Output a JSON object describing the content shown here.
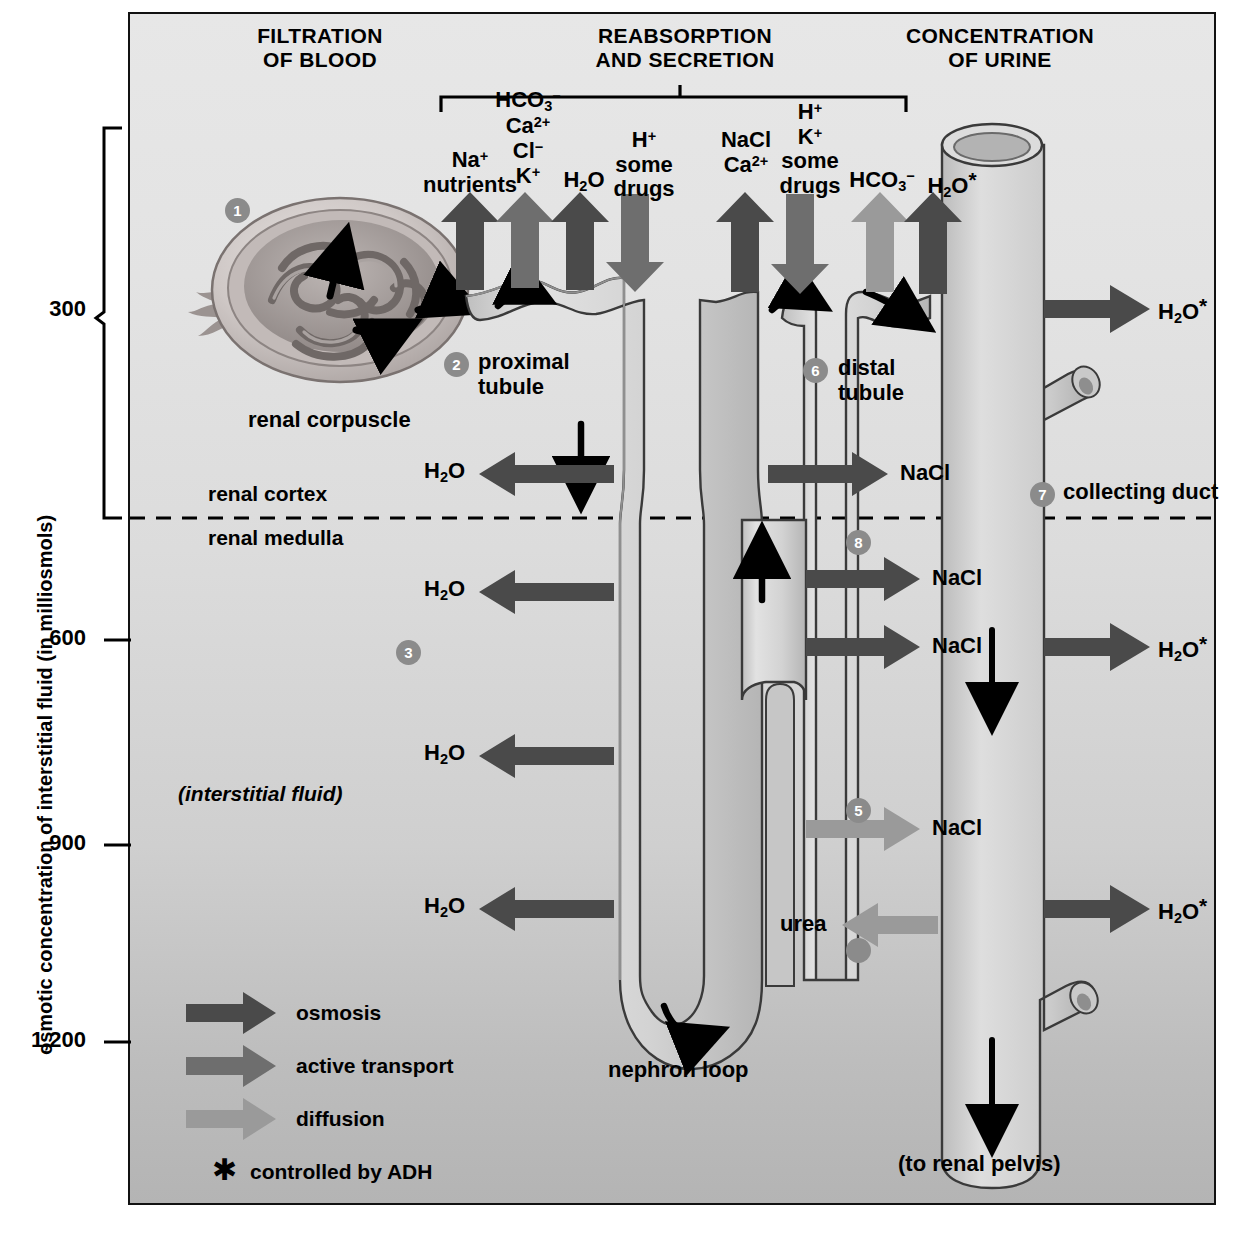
{
  "figure": {
    "type": "anatomical-diagram"
  },
  "headers": [
    {
      "id": "filtration",
      "line1": "FILTRATION",
      "line2": "OF BLOOD"
    },
    {
      "id": "reabsorption",
      "line1": "REABSORPTION",
      "line2": "AND SECRETION"
    },
    {
      "id": "concentration",
      "line1": "CONCENTRATION",
      "line2": "OF URINE"
    }
  ],
  "axis": {
    "title": "osmotic concentration of interstitial fluid (in milliosmols)",
    "ticks": [
      "300",
      "600",
      "900",
      "1,200"
    ]
  },
  "regions": {
    "cortex": "renal cortex",
    "medulla": "renal medulla",
    "interstitial": "(interstitial fluid)"
  },
  "structures": [
    {
      "num": "1",
      "label": "renal corpuscle"
    },
    {
      "num": "2",
      "label_line1": "proximal",
      "label_line2": "tubule"
    },
    {
      "num": "6",
      "label_line1": "distal",
      "label_line2": "tubule"
    },
    {
      "num": "7",
      "label": "collecting duct"
    },
    {
      "num": "3",
      "label": ""
    },
    {
      "num": "4",
      "label": ""
    },
    {
      "num": "5",
      "label": ""
    },
    {
      "num": "8",
      "label": ""
    }
  ],
  "loop_label": "nephron loop",
  "pelvis_label": "(to renal pelvis)",
  "proximal_transport": [
    {
      "id": "na-nutrients",
      "lines": [
        "Na⁺",
        "nutrients"
      ],
      "arrow": "up",
      "mode": "osmosis"
    },
    {
      "id": "hco3-ca-cl-k",
      "lines": [
        "HCO₃⁻",
        "Ca²⁺",
        "Cl⁻",
        "K⁺"
      ],
      "arrow": "up",
      "mode": "active_transport"
    },
    {
      "id": "h2o-proximal",
      "lines": [
        "H₂O"
      ],
      "arrow": "up",
      "mode": "osmosis"
    },
    {
      "id": "h-some-drugs",
      "lines": [
        "H⁺",
        "some",
        "drugs"
      ],
      "arrow": "down",
      "mode": "active_transport"
    }
  ],
  "distal_transport": [
    {
      "id": "nacl-ca",
      "lines": [
        "NaCl",
        "Ca²⁺"
      ],
      "arrow": "up",
      "mode": "osmosis"
    },
    {
      "id": "h-k-some-drugs",
      "lines": [
        "H⁺",
        "K⁺",
        "some",
        "drugs"
      ],
      "arrow": "down",
      "mode": "active_transport"
    },
    {
      "id": "hco3-distal",
      "lines": [
        "HCO₃⁻"
      ],
      "arrow": "up",
      "mode": "diffusion"
    },
    {
      "id": "h2o-distal",
      "lines": [
        "H₂O*"
      ],
      "arrow": "up",
      "mode": "osmosis"
    }
  ],
  "loop_exchanges": [
    {
      "id": "h2o-cortex",
      "label": "H₂O",
      "direction": "left",
      "mode": "osmosis"
    },
    {
      "id": "h2o-medulla1",
      "label": "H₂O",
      "direction": "left",
      "mode": "osmosis"
    },
    {
      "id": "h2o-medulla2",
      "label": "H₂O",
      "direction": "left",
      "mode": "osmosis"
    },
    {
      "id": "h2o-medulla3",
      "label": "H₂O",
      "direction": "left",
      "mode": "osmosis"
    },
    {
      "id": "nacl-cortex",
      "label": "NaCl",
      "direction": "right",
      "mode": "osmosis"
    },
    {
      "id": "nacl-med1",
      "label": "NaCl",
      "direction": "right",
      "mode": "osmosis"
    },
    {
      "id": "nacl-med2",
      "label": "NaCl",
      "direction": "right",
      "mode": "osmosis"
    },
    {
      "id": "nacl-med3",
      "label": "NaCl",
      "direction": "right",
      "mode": "diffusion"
    },
    {
      "id": "urea",
      "label": "urea",
      "direction": "left",
      "mode": "diffusion"
    }
  ],
  "duct_outputs": [
    {
      "id": "h2o-duct-1",
      "label": "H₂O*",
      "mode": "osmosis"
    },
    {
      "id": "h2o-duct-2",
      "label": "H₂O*",
      "mode": "osmosis"
    },
    {
      "id": "h2o-duct-3",
      "label": "H₂O*",
      "mode": "osmosis"
    }
  ],
  "legend": {
    "items": [
      {
        "id": "osmosis",
        "label": "osmosis",
        "color": "#4a4a4a"
      },
      {
        "id": "active-transport",
        "label": "active transport",
        "color": "#6e6e6e"
      },
      {
        "id": "diffusion",
        "label": "diffusion",
        "color": "#9a9a9a"
      }
    ],
    "adh": {
      "symbol": "✱",
      "label": "controlled by ADH"
    }
  },
  "colors": {
    "osmosis": "#4a4a4a",
    "active_transport": "#6e6e6e",
    "diffusion": "#9a9a9a",
    "tubule_fill": "#cfcfcf",
    "tubule_stroke": "#3a3a3a",
    "marker": "#8b8b8b",
    "panel_top": "#e7e7e7",
    "panel_bottom": "#b4b4b4"
  }
}
